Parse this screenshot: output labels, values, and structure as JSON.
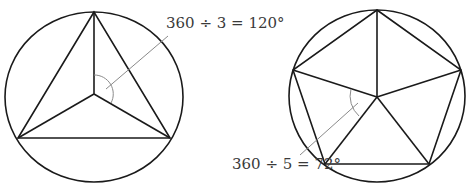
{
  "figures": [
    {
      "name": "triangle-in-circle",
      "sides": 3,
      "label": "360 ÷ 3 = 120°"
    },
    {
      "name": "pentagon-in-circle",
      "sides": 5,
      "label": "360 ÷ 5 = 72°"
    }
  ],
  "colors": {
    "stroke": "#1a1a1a",
    "leader": "#8a8a8a",
    "text": "#3a3a3a"
  }
}
